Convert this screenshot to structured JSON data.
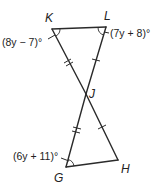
{
  "diagram": {
    "type": "geometry-figure",
    "vertices": {
      "K": {
        "label": "K",
        "x": 52,
        "y": 29
      },
      "L": {
        "label": "L",
        "x": 106,
        "y": 27
      },
      "J": {
        "label": "J",
        "x": 86,
        "y": 94
      },
      "G": {
        "label": "G",
        "x": 66,
        "y": 167
      },
      "H": {
        "label": "H",
        "x": 118,
        "y": 160
      }
    },
    "segments": [
      "KL",
      "KJ",
      "JH",
      "LJ",
      "JG",
      "GH"
    ],
    "congruence_marks": {
      "single_tick": [
        "LJ",
        "JH"
      ],
      "double_tick": [
        "KJ",
        "JG"
      ]
    },
    "angle_labels": {
      "K": "(8y − 7)°",
      "L": "(7y + 8)°",
      "G": "(6y + 11)°"
    },
    "colors": {
      "stroke": "#2a2a2a",
      "text": "#222222",
      "background": "#ffffff"
    }
  }
}
